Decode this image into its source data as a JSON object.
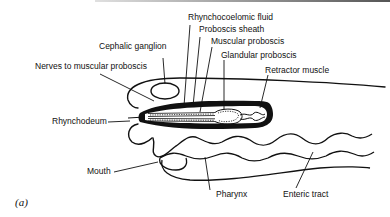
{
  "figure": {
    "panel_label": "(a)",
    "labels": {
      "rhynchocoelomic_fluid": "Rhynchocoelomic fluid",
      "proboscis_sheath": "Proboscis sheath",
      "muscular_proboscis": "Muscular proboscis",
      "glandular_proboscis": "Glandular proboscis",
      "retractor_muscle": "Retractor muscle",
      "cephalic_ganglion": "Cephalic ganglion",
      "nerves_to_muscular_proboscis": "Nerves to muscular proboscis",
      "rhynchodeum": "Rhynchodeum",
      "mouth": "Mouth",
      "pharynx": "Pharynx",
      "enteric_tract": "Enteric tract"
    },
    "colors": {
      "ink": "#111111",
      "background": "#ffffff"
    }
  }
}
